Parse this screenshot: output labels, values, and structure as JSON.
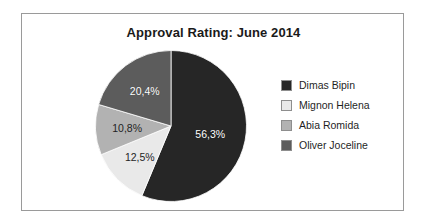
{
  "chart_data": {
    "type": "pie",
    "title": "Approval Rating: June 2014",
    "xlabel": "",
    "ylabel": "",
    "legend_position": "right",
    "grid": false,
    "start_angle_deg": 0,
    "direction": "clockwise",
    "categories": [
      "Dimas Bipin",
      "Mignon Helena",
      "Abia Romida",
      "Oliver Joceline"
    ],
    "values": [
      56.3,
      12.5,
      10.8,
      20.4
    ],
    "labels": [
      "56,3%",
      "12,5%",
      "10,8%",
      "20,4%"
    ],
    "colors": [
      "#262626",
      "#e9e9e9",
      "#b2b2b2",
      "#5c5c5c"
    ],
    "slices": [
      {
        "name": "Dimas Bipin",
        "value": 56.3,
        "label": "56,3%",
        "color": "#262626",
        "label_color": "light"
      },
      {
        "name": "Mignon Helena",
        "value": 12.5,
        "label": "12,5%",
        "color": "#e9e9e9",
        "label_color": "dark"
      },
      {
        "name": "Abia Romida",
        "value": 10.8,
        "label": "10,8%",
        "color": "#b2b2b2",
        "label_color": "dark"
      },
      {
        "name": "Oliver Joceline",
        "value": 20.4,
        "label": "20,4%",
        "color": "#5c5c5c",
        "label_color": "light"
      }
    ]
  },
  "legend": {
    "items": [
      {
        "label": "Dimas Bipin",
        "color": "#262626"
      },
      {
        "label": "Mignon Helena",
        "color": "#e9e9e9"
      },
      {
        "label": "Abia Romida",
        "color": "#b2b2b2"
      },
      {
        "label": "Oliver Joceline",
        "color": "#5c5c5c"
      }
    ]
  },
  "style": {
    "border_color": "#9a9a9a",
    "background": "#ffffff",
    "title_color": "#1a1a1a"
  }
}
